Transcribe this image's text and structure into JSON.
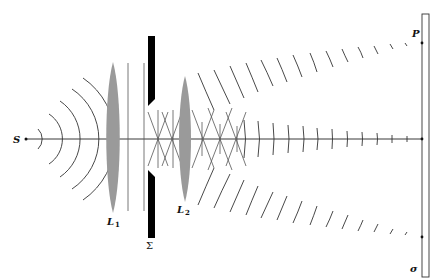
{
  "diagram": {
    "type": "optics-wavefront-diagram",
    "colors": {
      "lens": "#9a9a9a",
      "stop": "#000000",
      "lines": "#333333",
      "background": "#ffffff"
    },
    "labels": {
      "source": "S",
      "lens1_main": "L",
      "lens1_sub": "1",
      "lens2_main": "L",
      "lens2_sub": "2",
      "stop": "Σ",
      "point": "P",
      "screen": "σ"
    }
  }
}
